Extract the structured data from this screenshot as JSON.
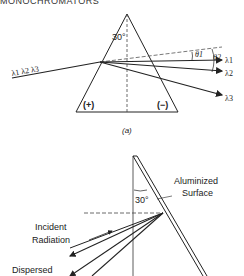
{
  "header": {
    "text": "MONOCHROMATORS"
  },
  "figure_a": {
    "apex_angle": "30°",
    "incident_label": "λ1 λ2 λ3",
    "outputs": [
      "λ1",
      "λ2",
      "λ3"
    ],
    "angles": [
      "θ1",
      "θ2"
    ],
    "left_sign": "(+)",
    "right_sign": "(−)",
    "caption": "(a)"
  },
  "figure_b": {
    "angle": "30°",
    "surface_label_line1": "Aluminized",
    "surface_label_line2": "Surface",
    "incident_line1": "Incident",
    "incident_line2": "Radiation",
    "dispersed_label": "Dispersed"
  }
}
